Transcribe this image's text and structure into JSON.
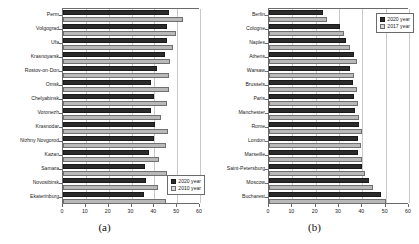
{
  "figure": {
    "panel_a_tag": "(a)",
    "panel_b_tag": "(b)"
  },
  "chart_data": [
    {
      "panel": "(a)",
      "type": "bar",
      "orientation": "horizontal",
      "title": "",
      "xlabel": "",
      "ylabel": "",
      "xlim": [
        0,
        60
      ],
      "xticks": [
        0,
        10,
        20,
        30,
        40,
        50,
        60
      ],
      "grid": true,
      "legend_position": "bottom-right",
      "categories": [
        "Perm",
        "Volgograd",
        "Ufa",
        "Krasnoyarsk",
        "Rostov-on-Don",
        "Omsk",
        "Chelyabinsk",
        "Voronezh",
        "Krasnodar",
        "Nizhny Novgorod",
        "Kazan",
        "Samara",
        "Novosibirsk",
        "Ekaterinburg"
      ],
      "series": [
        {
          "name": "2020 year",
          "color": "#2b2b2b",
          "values": [
            46.5,
            45.5,
            45.5,
            44.5,
            41.0,
            38.5,
            40.0,
            38.5,
            40.5,
            40.0,
            37.5,
            36.0,
            36.5,
            35.5
          ]
        },
        {
          "name": "2010 year",
          "color": "#b9b9b9",
          "values": [
            52.5,
            49.5,
            48.0,
            47.0,
            46.5,
            46.5,
            45.5,
            43.0,
            46.0,
            45.0,
            42.0,
            45.5,
            41.5,
            45.0
          ]
        }
      ]
    },
    {
      "panel": "(b)",
      "type": "bar",
      "orientation": "horizontal",
      "title": "",
      "xlabel": "",
      "ylabel": "",
      "xlim": [
        0,
        60
      ],
      "xticks": [
        0,
        10,
        20,
        30,
        40,
        50,
        60
      ],
      "grid": true,
      "legend_position": "top-right",
      "categories": [
        "Berlin",
        "Cologne",
        "Naples",
        "Athens",
        "Warsaw",
        "Brussels",
        "Paris",
        "Manchester",
        "Rome",
        "London",
        "Marseille",
        "Saint-Petersburg",
        "Moscow",
        "Bucharest"
      ],
      "series": [
        {
          "name": "2020 year",
          "color": "#2b2b2b",
          "values": [
            23.0,
            30.5,
            33.0,
            36.5,
            34.5,
            36.0,
            36.5,
            37.0,
            38.5,
            38.0,
            38.0,
            40.0,
            43.0,
            48.0
          ]
        },
        {
          "name": "2017 year",
          "color": "#b9b9b9",
          "values": [
            25.0,
            32.0,
            34.5,
            37.5,
            36.5,
            37.5,
            38.0,
            38.5,
            40.0,
            39.5,
            40.0,
            41.0,
            44.5,
            50.0
          ]
        }
      ]
    }
  ]
}
